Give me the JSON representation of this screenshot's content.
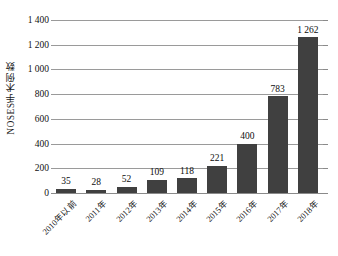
{
  "chart_data": {
    "type": "bar",
    "title": "",
    "xlabel": "",
    "ylabel": "NOSES手术例数",
    "categories": [
      "2010年以前",
      "2011年",
      "2012年",
      "2013年",
      "2014年",
      "2015年",
      "2016年",
      "2017年",
      "2018年"
    ],
    "values": [
      35,
      28,
      52,
      109,
      118,
      221,
      400,
      783,
      1262
    ],
    "value_labels": [
      "35",
      "28",
      "52",
      "109",
      "118",
      "221",
      "400",
      "783",
      "1 262"
    ],
    "ylim": [
      0,
      1400
    ],
    "ytick_values": [
      0,
      200,
      400,
      600,
      800,
      1000,
      1200,
      1400
    ],
    "ytick_labels": [
      "0",
      "200",
      "400",
      "600",
      "800",
      "1 000",
      "1 200",
      "1 400"
    ],
    "grid": true,
    "legend": "none",
    "series_color": "#404040",
    "gridline_color": "#9a9a9a"
  }
}
